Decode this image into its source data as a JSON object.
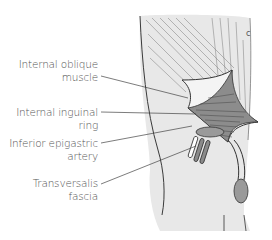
{
  "figure": {
    "labels": [
      {
        "id": "internal-oblique-muscle",
        "lines": [
          "Internal oblique",
          "muscle"
        ]
      },
      {
        "id": "internal-inguinal-ring",
        "lines": [
          "Internal inguinal",
          "ring"
        ]
      },
      {
        "id": "inferior-epigastric-artery",
        "lines": [
          "Inferior epigastric",
          "artery"
        ]
      },
      {
        "id": "transversalis-fascia",
        "lines": [
          "Transversalis",
          "fascia"
        ]
      }
    ],
    "colors": {
      "skin_fill": "#e6e6e6",
      "outline": "#3a3a3a",
      "muscle_dark": "#6e6e6e",
      "vessel_fill": "#8a8a8a",
      "text": "#555555"
    }
  }
}
